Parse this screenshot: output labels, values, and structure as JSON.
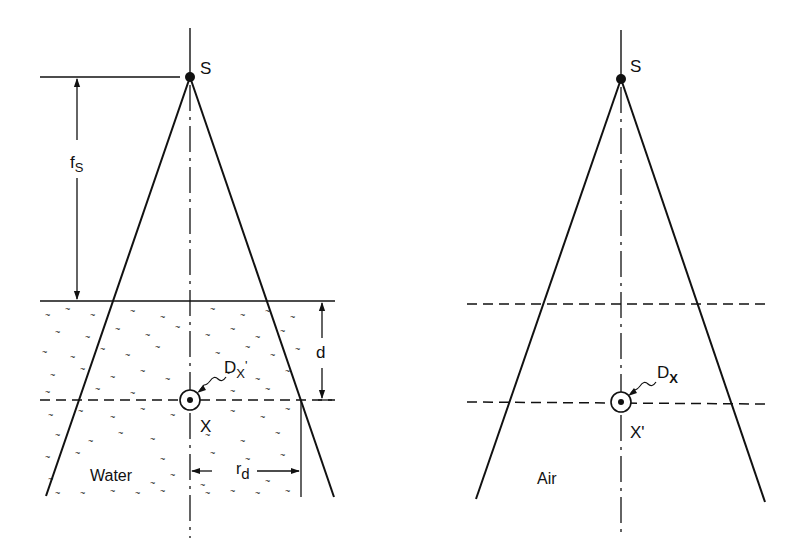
{
  "figure": {
    "colors": {
      "ink": "#111111",
      "background": "#ffffff"
    }
  },
  "left_panel": {
    "source_label": "S",
    "distance_label_main": "f",
    "distance_label_sub": "S",
    "depth_label": "d",
    "dose_label_main": "D",
    "dose_label_sub": "X",
    "dose_label_prime": "'",
    "point_label": "X",
    "radius_label_main": "r",
    "radius_label_sub": "d",
    "medium_label": "Water"
  },
  "right_panel": {
    "source_label": "S",
    "dose_label_main": "D",
    "dose_label_sub": "X",
    "point_label": "X'",
    "medium_label": "Air"
  }
}
